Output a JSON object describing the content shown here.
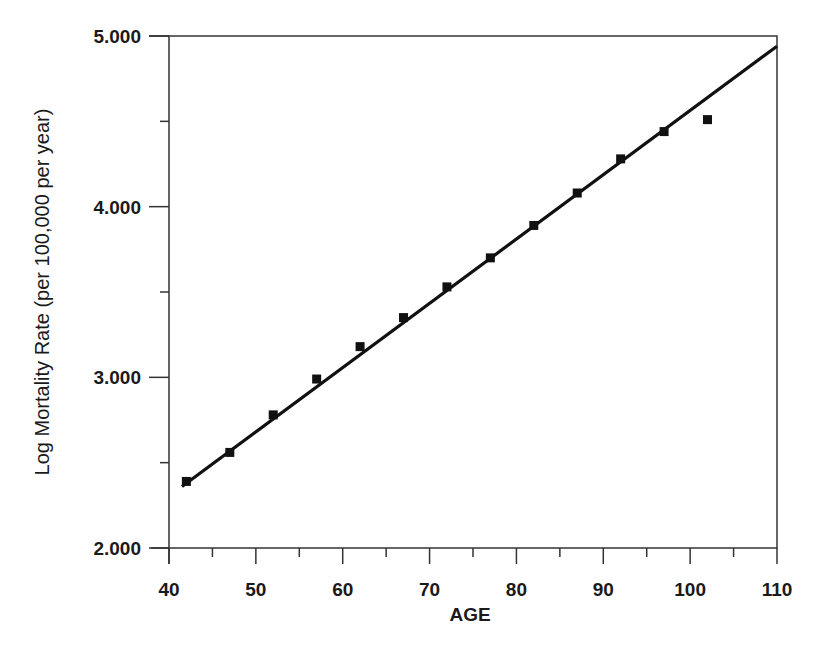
{
  "chart_data": {
    "type": "scatter",
    "title": "",
    "xlabel": "AGE",
    "ylabel": "Log Mortality Rate (per 100,000 per year)",
    "xlim": [
      40,
      110
    ],
    "ylim": [
      2.0,
      5.0
    ],
    "x_ticks": [
      "40",
      "50",
      "60",
      "70",
      "80",
      "90",
      "100",
      "110"
    ],
    "y_ticks": [
      "2.000",
      "3.000",
      "4.000",
      "5.000"
    ],
    "grid": false,
    "legend": null,
    "series": [
      {
        "name": "Observed",
        "marker": "square",
        "x": [
          42,
          47,
          52,
          57,
          62,
          67,
          72,
          77,
          82,
          87,
          92,
          97,
          102
        ],
        "values": [
          2.39,
          2.56,
          2.78,
          2.99,
          3.18,
          3.35,
          3.53,
          3.7,
          3.89,
          4.08,
          4.28,
          4.44,
          4.51
        ]
      },
      {
        "name": "Fitted line",
        "type": "line",
        "x": [
          41.5,
          110
        ],
        "values": [
          2.36,
          4.94
        ]
      }
    ]
  },
  "axes": {
    "x_title": "AGE",
    "y_title": "Log Mortality Rate (per 100,000 per year)"
  },
  "colors": {
    "ink": "#111111",
    "axis": "#333333"
  }
}
